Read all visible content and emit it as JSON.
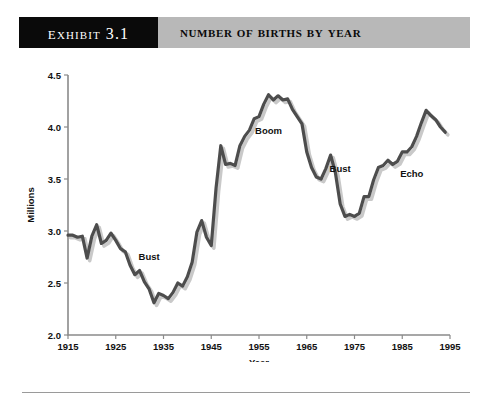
{
  "header": {
    "exhibit_label": "Exhibit 3.1",
    "title": "Number of Births by Year"
  },
  "chart_data": {
    "type": "line",
    "title": "Number of Births by Year",
    "xlabel": "Year",
    "ylabel": "Millions",
    "xlim": [
      1915,
      1995
    ],
    "ylim": [
      2.0,
      4.5
    ],
    "xticks": [
      1915,
      1925,
      1935,
      1945,
      1955,
      1965,
      1975,
      1985,
      1995
    ],
    "yticks": [
      "2.0",
      "2.5",
      "3.0",
      "3.5",
      "4.0",
      "4.5"
    ],
    "grid": false,
    "legend": "none",
    "series": [
      {
        "name": "Births",
        "x": [
          1915,
          1916,
          1917,
          1918,
          1919,
          1920,
          1921,
          1922,
          1923,
          1924,
          1925,
          1926,
          1927,
          1928,
          1929,
          1930,
          1931,
          1932,
          1933,
          1934,
          1935,
          1936,
          1937,
          1938,
          1939,
          1940,
          1941,
          1942,
          1943,
          1944,
          1945,
          1946,
          1947,
          1948,
          1949,
          1950,
          1951,
          1952,
          1953,
          1954,
          1955,
          1956,
          1957,
          1958,
          1959,
          1960,
          1961,
          1962,
          1963,
          1964,
          1965,
          1966,
          1967,
          1968,
          1969,
          1970,
          1971,
          1972,
          1973,
          1974,
          1975,
          1976,
          1977,
          1978,
          1979,
          1980,
          1981,
          1982,
          1983,
          1984,
          1985,
          1986,
          1987,
          1988,
          1989,
          1990,
          1991,
          1992,
          1993,
          1994
        ],
        "values": [
          2.96,
          2.96,
          2.94,
          2.95,
          2.74,
          2.95,
          3.06,
          2.88,
          2.91,
          2.98,
          2.91,
          2.83,
          2.8,
          2.67,
          2.58,
          2.62,
          2.51,
          2.44,
          2.31,
          2.4,
          2.38,
          2.35,
          2.41,
          2.5,
          2.47,
          2.56,
          2.7,
          2.99,
          3.1,
          2.94,
          2.86,
          3.41,
          3.82,
          3.64,
          3.65,
          3.63,
          3.82,
          3.91,
          3.97,
          4.08,
          4.1,
          4.22,
          4.31,
          4.26,
          4.3,
          4.26,
          4.27,
          4.17,
          4.1,
          4.03,
          3.76,
          3.61,
          3.52,
          3.5,
          3.6,
          3.73,
          3.56,
          3.26,
          3.14,
          3.16,
          3.14,
          3.17,
          3.33,
          3.33,
          3.49,
          3.61,
          3.63,
          3.68,
          3.64,
          3.67,
          3.76,
          3.76,
          3.81,
          3.91,
          4.04,
          4.16,
          4.11,
          4.07,
          4.0,
          3.95
        ],
        "annotations": [
          {
            "label": "Bust",
            "x": 1932,
            "y": 2.72
          },
          {
            "label": "Boom",
            "x": 1957,
            "y": 3.93
          },
          {
            "label": "Bust",
            "x": 1972,
            "y": 3.57
          },
          {
            "label": "Echo",
            "x": 1987,
            "y": 3.52
          }
        ]
      }
    ]
  }
}
